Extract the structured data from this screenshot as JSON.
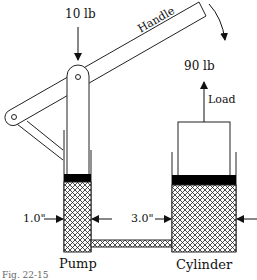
{
  "diagram": {
    "labels": {
      "input_force": "10 lb",
      "handle": "Handle",
      "output_force": "90  lb",
      "load": "Load",
      "pump_diameter": "1.0\"",
      "cylinder_diameter": "3.0\"",
      "pump": "Pump",
      "cylinder": "Cylinder",
      "caption_partial": "Fig. 22-15"
    },
    "colors": {
      "line": "#222222",
      "piston": "#000000",
      "background": "#ffffff"
    }
  }
}
